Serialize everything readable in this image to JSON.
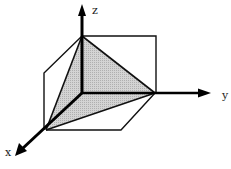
{
  "diagram": {
    "title": "",
    "axes": {
      "x": {
        "label": "x"
      },
      "y": {
        "label": "y"
      },
      "z": {
        "label": "z"
      }
    },
    "shaded_region": {
      "description": "tetrahedron bounded by coordinate planes and plane through intercepts on x, y, z axes",
      "fill_color": "#c8c8c8"
    },
    "colors": {
      "line": "#111111",
      "shade": "#c8c8c8",
      "background": "#ffffff"
    }
  }
}
